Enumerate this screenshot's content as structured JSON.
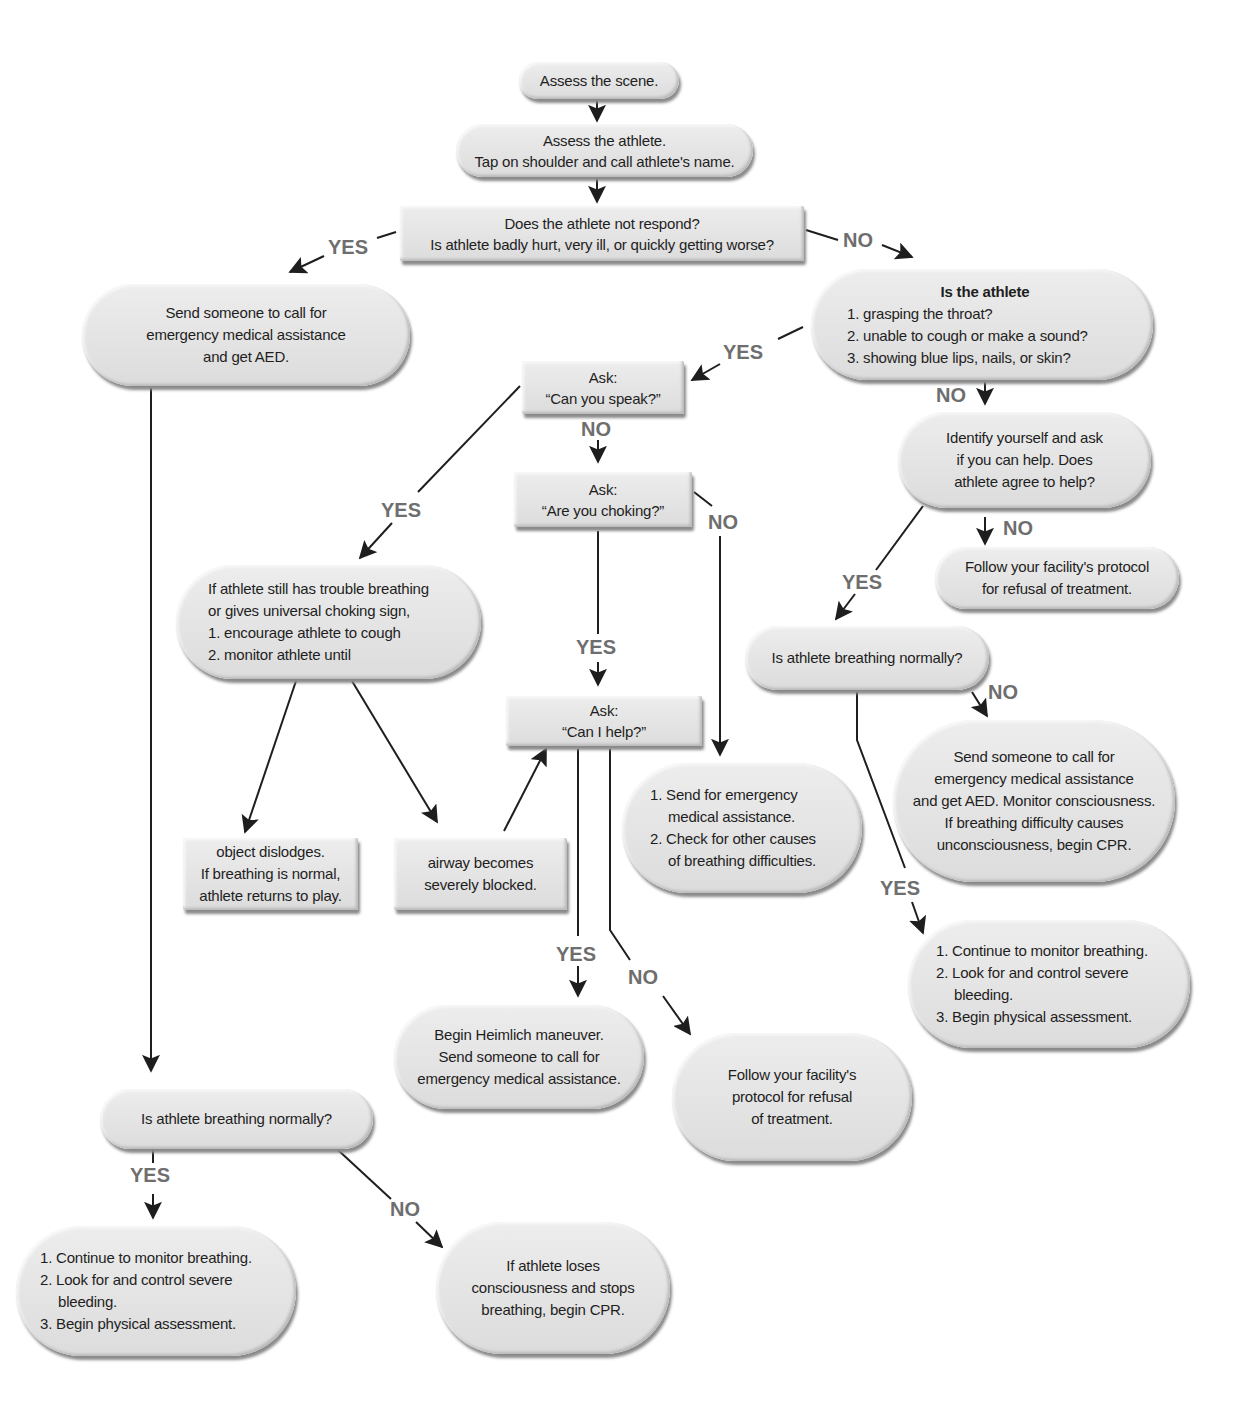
{
  "diagram": {
    "colors": {
      "node_fill": "#e4e4e4",
      "edge": "#1e1e1e",
      "label": "#6e6e6e",
      "text": "#1e1e1e"
    },
    "nodes": {
      "assess_scene": {
        "lines": [
          "Assess the scene."
        ]
      },
      "assess_athlete": {
        "lines": [
          "Assess the athlete.",
          "Tap on shoulder and call athlete's name."
        ]
      },
      "not_respond": {
        "lines": [
          "Does the athlete not respond?",
          "Is athlete badly hurt, very ill, or quickly getting worse?"
        ]
      },
      "send_aed": {
        "lines": [
          "Send someone to call for",
          "emergency medical assistance",
          "and get AED."
        ]
      },
      "is_athlete": {
        "title": "Is the athlete",
        "lines": [
          "1. grasping the throat?",
          "2. unable to cough or make a sound?",
          "3. showing blue lips, nails, or skin?"
        ]
      },
      "can_speak": {
        "lines": [
          "Ask:",
          "“Can you speak?”"
        ]
      },
      "identify": {
        "lines": [
          "Identify yourself and ask",
          "if you can help. Does",
          "athlete agree to help?"
        ]
      },
      "are_choking": {
        "lines": [
          "Ask:",
          "“Are you choking?”"
        ]
      },
      "refusal_right": {
        "lines": [
          "Follow your facility's protocol",
          "for refusal of treatment."
        ]
      },
      "trouble_breathing": {
        "lines": [
          "If athlete still has trouble breathing",
          "or gives universal choking sign,",
          "1. encourage athlete to cough",
          "2. monitor athlete until"
        ]
      },
      "breathing_right": {
        "lines": [
          "Is athlete breathing normally?"
        ]
      },
      "can_help": {
        "lines": [
          "Ask:",
          "“Can I help?”"
        ]
      },
      "send_emergency_check": {
        "lines": [
          "1. Send for emergency",
          "medical assistance.",
          "2. Check for other causes",
          "of breathing difficulties."
        ]
      },
      "send_aed_monitor": {
        "lines": [
          "Send someone to call for",
          "emergency medical assistance",
          "and get AED. Monitor consciousness.",
          "If breathing difficulty causes",
          "unconsciousness, begin CPR."
        ]
      },
      "object_dislodges": {
        "lines": [
          "object dislodges.",
          "If breathing is normal,",
          "athlete returns to play."
        ]
      },
      "airway_blocked": {
        "lines": [
          "airway becomes",
          "severely blocked."
        ]
      },
      "continue_right": {
        "lines": [
          "1. Continue to monitor breathing.",
          "2. Look for and control severe",
          "bleeding.",
          "3. Begin physical assessment."
        ]
      },
      "heimlich": {
        "lines": [
          "Begin Heimlich maneuver.",
          "Send someone to call for",
          "emergency medical assistance."
        ]
      },
      "refusal_center": {
        "lines": [
          "Follow your facility's",
          "protocol for refusal",
          "of treatment."
        ]
      },
      "breathing_left": {
        "lines": [
          "Is athlete breathing normally?"
        ]
      },
      "continue_left": {
        "lines": [
          "1. Continue to monitor breathing.",
          "2. Look for and control severe",
          "bleeding.",
          "3. Begin physical assessment."
        ]
      },
      "loses_consciousness": {
        "lines": [
          "If athlete loses",
          "consciousness and stops",
          "breathing, begin CPR."
        ]
      }
    },
    "labels": {
      "yes_1": "YES",
      "no_1": "NO",
      "yes_2": "YES",
      "no_2": "NO",
      "no_3": "NO",
      "yes_3": "YES",
      "no_4": "NO",
      "no_5": "NO",
      "yes_4": "YES",
      "yes_5": "YES",
      "no_6": "NO",
      "yes_6": "YES",
      "yes_7": "YES",
      "no_7": "NO",
      "yes_8": "YES",
      "no_8": "NO"
    }
  }
}
